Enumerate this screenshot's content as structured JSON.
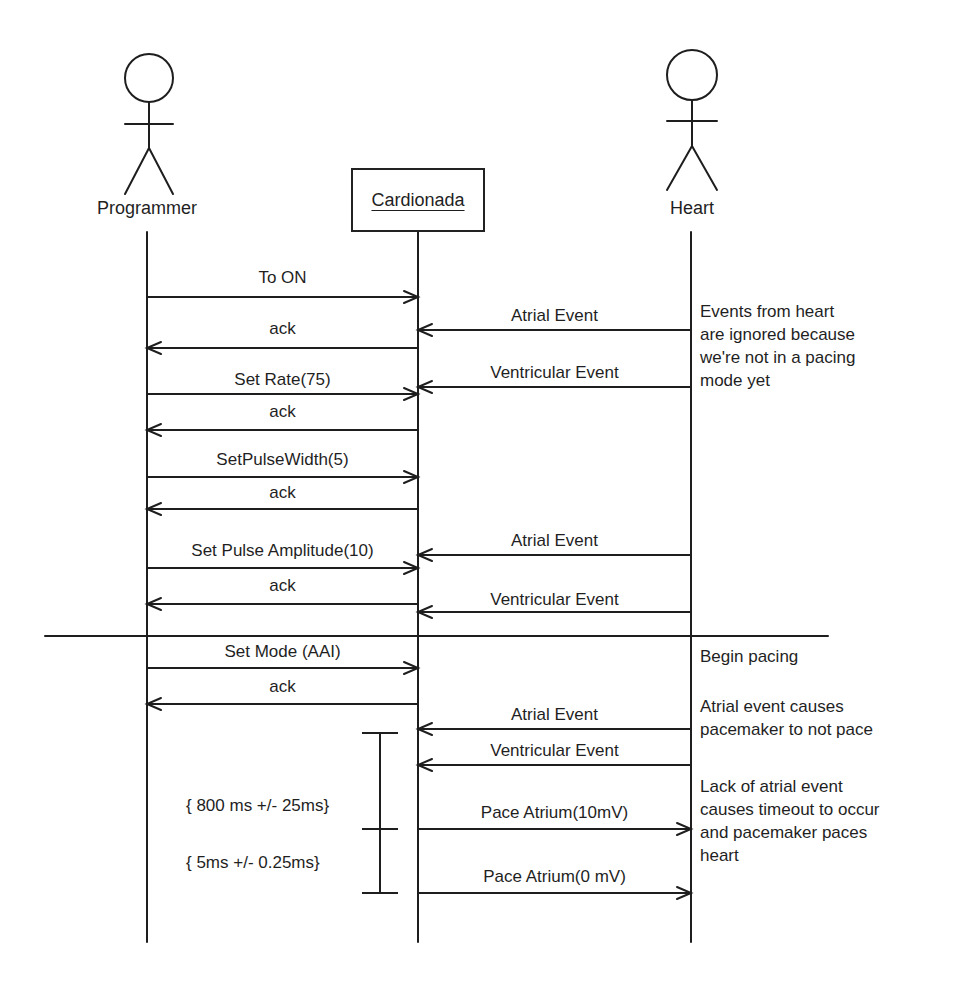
{
  "diagram": {
    "type": "sequence",
    "actors": [
      {
        "id": "programmer",
        "label": "Programmer",
        "kind": "actor",
        "x": 146
      },
      {
        "id": "cardionada",
        "label": "Cardionada",
        "kind": "object",
        "x": 418
      },
      {
        "id": "heart",
        "label": "Heart",
        "kind": "actor",
        "x": 691
      }
    ],
    "messages": [
      {
        "label": "To ON",
        "from": "programmer",
        "to": "cardionada",
        "y": 297,
        "label_y": 268
      },
      {
        "label": "Atrial Event",
        "from": "heart",
        "to": "cardionada",
        "y": 330,
        "label_y": 306
      },
      {
        "label": "ack",
        "from": "cardionada",
        "to": "programmer",
        "y": 348,
        "label_y": 319
      },
      {
        "label": "Ventricular Event",
        "from": "heart",
        "to": "cardionada",
        "y": 387,
        "label_y": 363
      },
      {
        "label": "Set Rate(75)",
        "from": "programmer",
        "to": "cardionada",
        "y": 394,
        "label_y": 370
      },
      {
        "label": "ack",
        "from": "cardionada",
        "to": "programmer",
        "y": 430,
        "label_y": 402
      },
      {
        "label": "SetPulseWidth(5)",
        "from": "programmer",
        "to": "cardionada",
        "y": 477,
        "label_y": 450
      },
      {
        "label": "ack",
        "from": "cardionada",
        "to": "programmer",
        "y": 509,
        "label_y": 483
      },
      {
        "label": "Atrial Event",
        "from": "heart",
        "to": "cardionada",
        "y": 555,
        "label_y": 531
      },
      {
        "label": "Set Pulse Amplitude(10)",
        "from": "programmer",
        "to": "cardionada",
        "y": 568,
        "label_y": 541
      },
      {
        "label": "ack",
        "from": "cardionada",
        "to": "programmer",
        "y": 604,
        "label_y": 576
      },
      {
        "label": "Ventricular Event",
        "from": "heart",
        "to": "cardionada",
        "y": 612,
        "label_y": 590
      },
      {
        "label": "Set Mode (AAI)",
        "from": "programmer",
        "to": "cardionada",
        "y": 668,
        "label_y": 642
      },
      {
        "label": "ack",
        "from": "cardionada",
        "to": "programmer",
        "y": 704,
        "label_y": 677
      },
      {
        "label": "Atrial Event",
        "from": "heart",
        "to": "cardionada",
        "y": 729,
        "label_y": 705
      },
      {
        "label": "Ventricular Event",
        "from": "heart",
        "to": "cardionada",
        "y": 765,
        "label_y": 741
      },
      {
        "label": "Pace Atrium(10mV)",
        "from": "cardionada",
        "to": "heart",
        "y": 829,
        "label_y": 803
      },
      {
        "label": "Pace Atrium(0 mV)",
        "from": "cardionada",
        "to": "heart",
        "y": 893,
        "label_y": 867
      }
    ],
    "divider": {
      "x1": 45,
      "x2": 828,
      "y": 636
    },
    "timing_constraints": [
      {
        "label": "{ 800 ms +/- 25ms}",
        "y_top": 733,
        "y_bottom": 829,
        "label_y": 796
      },
      {
        "label": "{ 5ms +/- 0.25ms}",
        "y_top": 829,
        "y_bottom": 893,
        "label_y": 853
      }
    ],
    "notes": [
      {
        "lines": [
          "Events from heart",
          "are ignored because",
          "we're not in a pacing",
          "mode yet"
        ],
        "x": 700,
        "y": 300
      },
      {
        "lines": [
          "Begin pacing"
        ],
        "x": 700,
        "y": 645
      },
      {
        "lines": [
          "Atrial event causes",
          "pacemaker to not pace"
        ],
        "x": 700,
        "y": 695
      },
      {
        "lines": [
          "Lack of atrial event",
          "causes timeout to occur",
          "and pacemaker paces",
          "heart"
        ],
        "x": 700,
        "y": 775
      }
    ]
  }
}
